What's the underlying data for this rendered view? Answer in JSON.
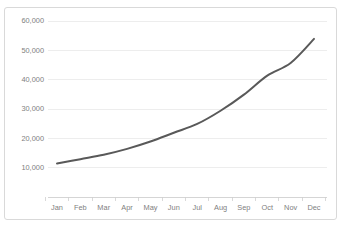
{
  "chart_data": {
    "type": "line",
    "title": "",
    "subtitle": "",
    "xlabel": "",
    "ylabel": "",
    "categories": [
      "Jan",
      "Feb",
      "Mar",
      "Apr",
      "May",
      "Jun",
      "Jul",
      "Aug",
      "Sep",
      "Oct",
      "Nov",
      "Dec"
    ],
    "series": [
      {
        "name": "",
        "values": [
          11500,
          13000,
          14500,
          16500,
          19000,
          22000,
          25000,
          29500,
          35000,
          41500,
          45800,
          54000
        ]
      }
    ],
    "ylim": [
      0,
      60000
    ],
    "ytick_labels": [
      "60,000",
      "50,000",
      "40,000",
      "30,000",
      "20,000",
      "10,000"
    ],
    "ytick_values": [
      60000,
      50000,
      40000,
      30000,
      20000,
      10000
    ],
    "grid": true,
    "grid_axis": "y",
    "legend": false,
    "legend_position": "none",
    "colors": {
      "line": "#595959",
      "grid": "#e8e8e8",
      "axis": "#d0d0d0",
      "tick_label": "#808080",
      "frame_border": "#d9d9d9",
      "background": "#ffffff"
    }
  },
  "frame": {
    "label": "chart-frame"
  }
}
